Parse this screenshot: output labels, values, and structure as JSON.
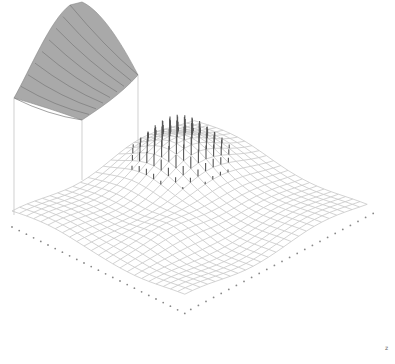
{
  "figure": {
    "type": "3d-wireframe-surface",
    "colors": {
      "background": "#ffffff",
      "mesh": "#c8c8c8",
      "sticks": "#555555",
      "panel_fill": "#a9a9a9",
      "panel_stripes": "#7a7a7a",
      "dots": "#888888"
    },
    "grid": {
      "cols": 24,
      "rows": 24
    },
    "corner_label": "z"
  }
}
